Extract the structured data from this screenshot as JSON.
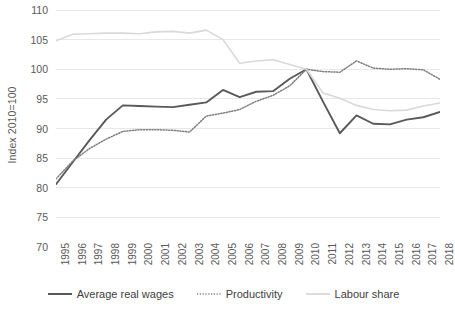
{
  "chart_data": {
    "type": "line",
    "title": "",
    "xlabel": "",
    "ylabel": "Index 2010=100",
    "ylim": [
      70,
      110
    ],
    "y_ticks": [
      70,
      75,
      80,
      85,
      90,
      95,
      100,
      105,
      110
    ],
    "grid": true,
    "legend_position": "bottom",
    "categories": [
      "1995",
      "1996",
      "1997",
      "1998",
      "1999",
      "2000",
      "2001",
      "2002",
      "2003",
      "2004",
      "2005",
      "2006",
      "2007",
      "2008",
      "2009",
      "2010",
      "2011",
      "2012",
      "2013",
      "2014",
      "2015",
      "2016",
      "2017",
      "2018"
    ],
    "series": [
      {
        "name": "Average real wages",
        "style": "solid",
        "color": "#595959",
        "values": [
          80.6,
          84.3,
          88.0,
          91.5,
          93.9,
          93.8,
          93.7,
          93.6,
          94.0,
          94.4,
          96.5,
          95.3,
          96.2,
          96.3,
          98.4,
          100.0,
          94.5,
          89.2,
          92.2,
          90.8,
          90.7,
          91.5,
          91.9,
          92.8
        ]
      },
      {
        "name": "Productivity",
        "style": "dotted",
        "color": "#7f7f7f",
        "values": [
          81.5,
          84.5,
          86.6,
          88.2,
          89.5,
          89.8,
          89.8,
          89.7,
          89.4,
          92.1,
          92.6,
          93.2,
          94.6,
          95.6,
          97.2,
          100.0,
          99.6,
          99.5,
          101.4,
          100.2,
          100.0,
          100.1,
          99.9,
          98.3
        ]
      },
      {
        "name": "Labour share",
        "style": "solid-light",
        "color": "#d9d9d9",
        "values": [
          104.8,
          105.9,
          106.0,
          106.1,
          106.1,
          106.0,
          106.3,
          106.4,
          106.1,
          106.6,
          105.0,
          101.0,
          101.4,
          101.6,
          100.8,
          100.0,
          96.0,
          95.1,
          93.9,
          93.2,
          93.0,
          93.1,
          93.8,
          94.3
        ]
      }
    ]
  },
  "legend": {
    "items": [
      {
        "label": "Average real wages",
        "swatch": "solid-line-swatch"
      },
      {
        "label": "Productivity",
        "swatch": "dotted-line-swatch"
      },
      {
        "label": "Labour share",
        "swatch": "light-line-swatch"
      }
    ]
  },
  "colors": {
    "wages": "#595959",
    "productivity": "#7f7f7f",
    "labour_share": "#d9d9d9",
    "gridline": "#e8e8e8",
    "text": "#595959",
    "background": "#ffffff"
  }
}
